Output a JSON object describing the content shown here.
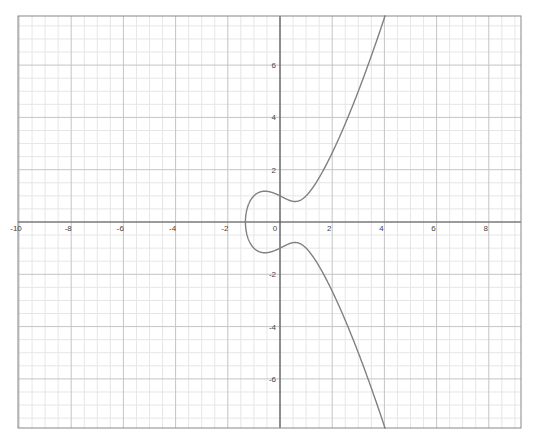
{
  "chart_data": {
    "type": "line",
    "title": "",
    "xlabel": "",
    "ylabel": "",
    "xlim": [
      -10,
      9.23
    ],
    "ylim": [
      -7.89,
      7.89
    ],
    "grid": true,
    "grid_major_step": 2,
    "grid_minor_step": 0.5,
    "legend": null,
    "x_ticks": [
      -10,
      -8,
      -6,
      -4,
      -2,
      0,
      2,
      4,
      6,
      8
    ],
    "y_ticks": [
      -6,
      -4,
      -2,
      2,
      4,
      6
    ],
    "x_tick_labels": [
      "-10",
      "-8",
      "-6",
      "-4",
      "-2",
      "0",
      "2",
      "4",
      "6",
      "8"
    ],
    "y_tick_labels": [
      "-6",
      "-4",
      "-2",
      "2",
      "4",
      "6"
    ],
    "series": [
      {
        "name": "y^2 = x^3 - x + 1",
        "equation": "y^2 = x^3 - x + 1",
        "color": "#808080",
        "x": [
          -1.3247,
          -1.3,
          -1.2,
          -1.0,
          -0.8,
          -0.577,
          -0.4,
          -0.2,
          0,
          0.2,
          0.4,
          0.577,
          0.8,
          1.0,
          1.5,
          2.0,
          2.5,
          3.0,
          3.5,
          4.0
        ],
        "y_upper": [
          0,
          0.28,
          0.61,
          1.0,
          1.13,
          1.18,
          1.16,
          1.09,
          1.0,
          0.9,
          0.8,
          0.76,
          0.79,
          1.0,
          1.62,
          2.65,
          3.71,
          5.0,
          6.34,
          7.81
        ],
        "y_lower": [
          0,
          -0.28,
          -0.61,
          -1.0,
          -1.13,
          -1.18,
          -1.16,
          -1.09,
          -1.0,
          -0.9,
          -0.8,
          -0.76,
          -0.79,
          -1.0,
          -1.62,
          -2.65,
          -3.71,
          -5.0,
          -6.34,
          -7.81
        ]
      }
    ]
  },
  "colors": {
    "background": "#ffffff",
    "minor_grid": "#e6e6e6",
    "major_grid": "#c4c4c4",
    "axis": "#555555",
    "frame": "#888888",
    "curve": "#808080"
  },
  "layout": {
    "plot_left": 18,
    "plot_top": 16,
    "plot_right": 521,
    "plot_bottom": 428,
    "origin_x": 280,
    "origin_y": 222,
    "px_per_unit_x": 26.1,
    "px_per_unit_y": 26.15
  }
}
